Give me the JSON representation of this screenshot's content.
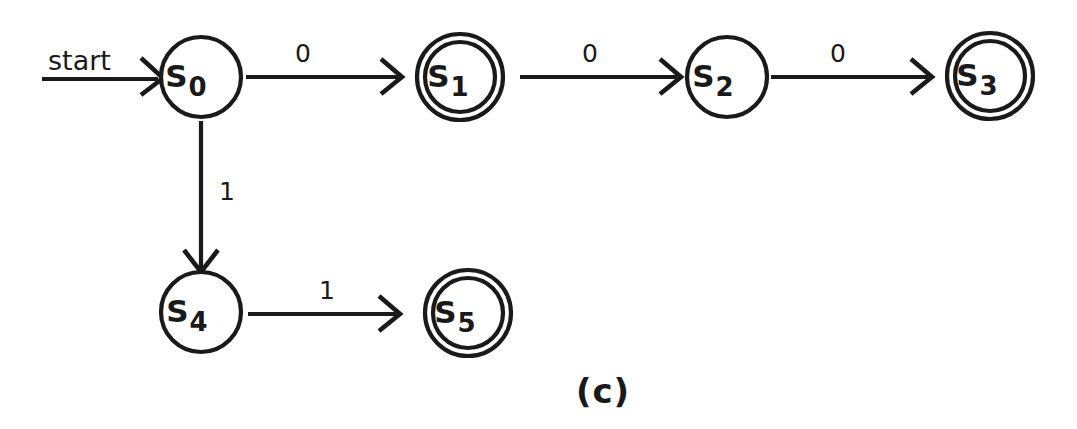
{
  "figure": {
    "caption": "(c)",
    "caption_x": 603,
    "caption_y": 403,
    "width": 1077,
    "height": 429,
    "background_color": "#ffffff",
    "ink_color": "#1a1a1a",
    "type": "finite-state-machine"
  },
  "start": {
    "label": "start",
    "label_x": 48,
    "label_y": 70,
    "line_x1": 42,
    "line_x2": 158,
    "line_y": 79,
    "target_state": "s0"
  },
  "states": [
    {
      "id": "s0",
      "name": "S",
      "subscript": "0",
      "cx": 201,
      "cy": 77,
      "r_outer": 40,
      "r_inner": 0,
      "accepting": false
    },
    {
      "id": "s1",
      "name": "S",
      "subscript": "1",
      "cx": 460,
      "cy": 77,
      "r_outer": 43,
      "r_inner": 35,
      "accepting": true
    },
    {
      "id": "s2",
      "name": "S",
      "subscript": "2",
      "cx": 727,
      "cy": 77,
      "r_outer": 40,
      "r_inner": 0,
      "accepting": false
    },
    {
      "id": "s3",
      "name": "S",
      "subscript": "3",
      "cx": 990,
      "cy": 76,
      "r_outer": 43,
      "r_inner": 35,
      "accepting": true
    },
    {
      "id": "s4",
      "name": "S",
      "subscript": "4",
      "cx": 201,
      "cy": 312,
      "r_outer": 40,
      "r_inner": 0,
      "accepting": false
    },
    {
      "id": "s5",
      "name": "S",
      "subscript": "5",
      "cx": 468,
      "cy": 313,
      "r_outer": 43,
      "r_inner": 35,
      "accepting": true
    }
  ],
  "transitions": [
    {
      "id": "t0",
      "from": "s0",
      "to": "s1",
      "symbol": "0",
      "orientation": "horizontal",
      "x1": 246,
      "x2": 402,
      "y": 77,
      "label_x": 303,
      "label_y": 62
    },
    {
      "id": "t1",
      "from": "s1",
      "to": "s2",
      "symbol": "0",
      "orientation": "horizontal",
      "x1": 520,
      "x2": 681,
      "y": 77,
      "label_x": 590,
      "label_y": 62
    },
    {
      "id": "t2",
      "from": "s2",
      "to": "s3",
      "symbol": "0",
      "orientation": "horizontal",
      "x1": 771,
      "x2": 932,
      "y": 77,
      "label_x": 838,
      "label_y": 62
    },
    {
      "id": "t3",
      "from": "s0",
      "to": "s4",
      "symbol": "1",
      "orientation": "vertical",
      "x": 201,
      "y1": 121,
      "y2": 271,
      "label_x": 219,
      "label_y": 200
    },
    {
      "id": "t4",
      "from": "s4",
      "to": "s5",
      "symbol": "1",
      "orientation": "horizontal",
      "x1": 248,
      "x2": 400,
      "y": 314,
      "label_x": 327,
      "label_y": 299
    }
  ]
}
